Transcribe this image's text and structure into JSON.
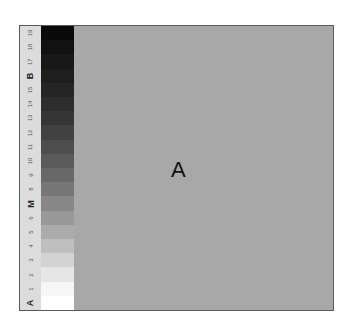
{
  "scale": {
    "labels": [
      "19",
      "18",
      "17",
      "B",
      "15",
      "14",
      "13",
      "12",
      "11",
      "10",
      "9",
      "8",
      "M",
      "6",
      "5",
      "4",
      "3",
      "2",
      "1",
      "A"
    ],
    "letter_labels": [
      "B",
      "M",
      "A"
    ],
    "swatches": [
      "#0a0a0a",
      "#111111",
      "#181818",
      "#1e1e1e",
      "#252525",
      "#2d2d2d",
      "#363636",
      "#414141",
      "#4d4d4d",
      "#5a5a5a",
      "#686868",
      "#777777",
      "#878787",
      "#999999",
      "#ababab",
      "#bfbfbf",
      "#d3d3d3",
      "#e6e6e6",
      "#f6f6f6",
      "#ffffff"
    ]
  },
  "main": {
    "background": "#a8a8a8",
    "center_label": "A"
  }
}
